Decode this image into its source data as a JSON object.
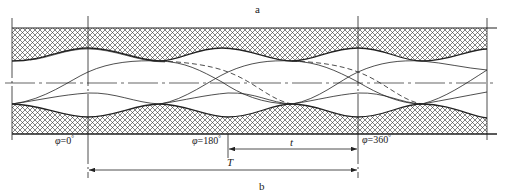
{
  "figure": {
    "label_top": "a",
    "label_bottom": "b",
    "phase_labels": [
      {
        "symbol": "φ",
        "text": "=0",
        "deg": "°"
      },
      {
        "symbol": "φ",
        "text": "=180",
        "deg": "°"
      },
      {
        "symbol": "φ",
        "text": "=360",
        "deg": "°"
      }
    ],
    "dim_small": "t",
    "dim_large": "T",
    "colors": {
      "line": "#222222",
      "hatch": "#333333",
      "background": "#ffffff"
    }
  }
}
